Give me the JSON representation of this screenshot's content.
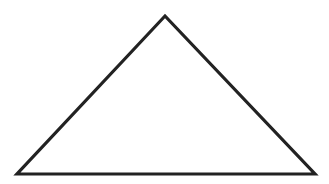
{
  "diagram": {
    "shape": "triangle",
    "vertices": [
      [
        165,
        16
      ],
      [
        17,
        174
      ],
      [
        315,
        174
      ]
    ],
    "stroke_color": "#222222",
    "stroke_width": 3.2,
    "fill_color": "#ffffff",
    "background": "#ffffff"
  }
}
